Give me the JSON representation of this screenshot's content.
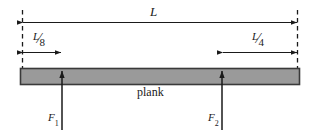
{
  "figure": {
    "type": "free-body-diagram",
    "background_color": "#ffffff",
    "line_color": "#1a1a1a"
  },
  "plank": {
    "label": "plank",
    "fill_color": "#9a9a9a",
    "border_color": "#3a3a3a",
    "left_px": 20,
    "right_px": 300,
    "top_px": 68,
    "bottom_px": 84
  },
  "dimensions": {
    "total": {
      "label": "L",
      "name": "total-length",
      "from_px": 22,
      "to_px": 298,
      "y_px": 22,
      "arrowheads": "both"
    },
    "left_offset": {
      "numerator": "L",
      "solidus": "⁄",
      "denominator": "8",
      "name": "left-offset-length",
      "from_px": 22,
      "to_px": 62,
      "y_px": 52,
      "arrowheads": "both"
    },
    "right_offset": {
      "numerator": "L",
      "solidus": "⁄",
      "denominator": "4",
      "name": "right-offset-length",
      "from_px": 222,
      "to_px": 298,
      "y_px": 52,
      "arrowheads": "both"
    }
  },
  "extension_lines": {
    "style": "dashed",
    "left_x_px": 22,
    "right_x_px": 298,
    "top_y_px": 10,
    "bottom_y_px": 68
  },
  "forces": [
    {
      "symbol": "F",
      "subscript": "1",
      "name": "force-f1",
      "x_px": 62,
      "tail_y_px": 130,
      "tip_y_px": 70,
      "direction": "up"
    },
    {
      "symbol": "F",
      "subscript": "2",
      "name": "force-f2",
      "x_px": 222,
      "tail_y_px": 130,
      "tip_y_px": 70,
      "direction": "up"
    }
  ]
}
